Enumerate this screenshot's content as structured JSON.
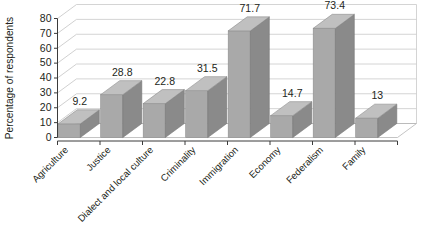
{
  "chart_data": {
    "type": "bar",
    "title": "",
    "subtitle": "",
    "xlabel": "",
    "ylabel": "Percentage of respondents",
    "categories": [
      "Agriculture",
      "Justice",
      "Dialect and local culture",
      "Criminality",
      "Immigration",
      "Economy",
      "Federalism",
      "Family"
    ],
    "values": [
      9.2,
      28.8,
      22.8,
      31.5,
      71.7,
      14.7,
      73.4,
      13
    ],
    "value_labels": [
      "9.2",
      "28.8",
      "22.8",
      "31.5",
      "71.7",
      "14.7",
      "73.4",
      "13"
    ],
    "ylim": [
      0,
      80
    ],
    "ytick_labels": [
      "0",
      "10",
      "20",
      "30",
      "40",
      "50",
      "60",
      "70",
      "80"
    ],
    "ytick_values": [
      0,
      10,
      20,
      30,
      40,
      50,
      60,
      70,
      80
    ],
    "grid": true,
    "legend": false,
    "legend_position": "none",
    "style": "3d-column",
    "colors": {
      "bar_front": "#a9a9a9",
      "bar_side": "#8a8a8a",
      "bar_top": "#c0c0c0",
      "gridline": "#c9c9c9",
      "axis": "#3b3b3b",
      "text": "#231f20",
      "background": "#ffffff"
    }
  }
}
